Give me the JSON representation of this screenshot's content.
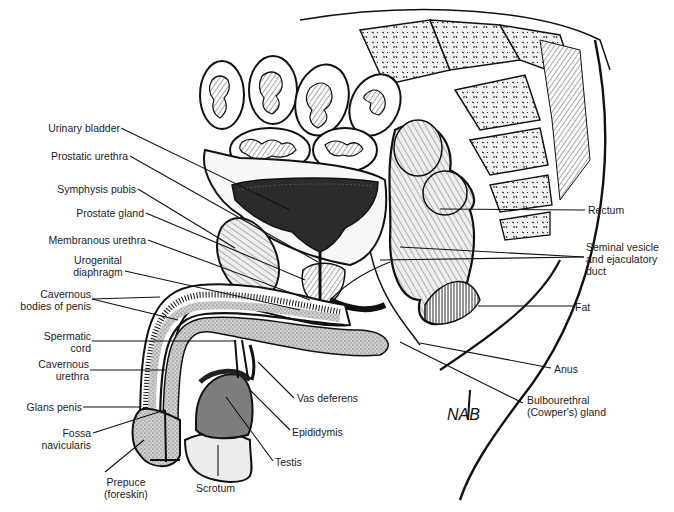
{
  "figure": {
    "signature": "NAB",
    "colors": {
      "line": "#111111",
      "dark_fill": "#2e2e2e",
      "mid_gray": "#7a7a7a",
      "light_gray": "#d9d9d9",
      "background": "#ffffff"
    }
  },
  "labels": {
    "left": [
      {
        "id": "urinary-bladder",
        "text": "Urinary bladder"
      },
      {
        "id": "prostatic-urethra",
        "text": "Prostatic urethra"
      },
      {
        "id": "symphysis-pubis",
        "text": "Symphysis pubis"
      },
      {
        "id": "prostate-gland",
        "text": "Prostate gland"
      },
      {
        "id": "membranous-urethra",
        "text": "Membranous urethra"
      },
      {
        "id": "urogenital-diaphragm",
        "text": "Urogenital\ndiaphragm",
        "line1": "Urogenital",
        "line2": "diaphragm"
      },
      {
        "id": "cavernous-bodies",
        "line1": "Cavernous",
        "line2": "bodies of penis"
      },
      {
        "id": "spermatic-cord",
        "line1": "Spermatic",
        "line2": "cord"
      },
      {
        "id": "cavernous-urethra",
        "line1": "Cavernous",
        "line2": "urethra"
      },
      {
        "id": "glans-penis",
        "text": "Glans penis"
      },
      {
        "id": "fossa-navicularis",
        "line1": "Fossa",
        "line2": "navicularis"
      }
    ],
    "bottom": [
      {
        "id": "prepuce",
        "line1": "Prepuce",
        "line2": "(foreskin)"
      },
      {
        "id": "scrotum",
        "text": "Scrotum"
      },
      {
        "id": "testis",
        "text": "Testis"
      },
      {
        "id": "epididymis",
        "text": "Epididymis"
      },
      {
        "id": "vas-deferens",
        "text": "Vas deferens"
      }
    ],
    "right": [
      {
        "id": "rectum",
        "text": "Rectum"
      },
      {
        "id": "seminal-vesicle",
        "line1": "Seminal vesicle",
        "line2": "and ejaculatory",
        "line3": "duct"
      },
      {
        "id": "fat",
        "text": "Fat"
      },
      {
        "id": "anus",
        "text": "Anus"
      },
      {
        "id": "bulbourethral",
        "line1": "Bulbourethral",
        "line2": "(Cowper's) gland"
      }
    ]
  }
}
